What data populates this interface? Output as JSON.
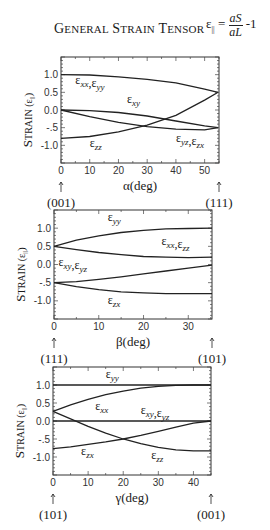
{
  "header": {
    "title": "General strain tensor",
    "formula_lhs": "ε",
    "formula_sub": "||",
    "formula_eq": "=",
    "formula_num": "aS",
    "formula_den": "aL",
    "formula_tail": "-1"
  },
  "chart_data": [
    {
      "type": "line",
      "title": "",
      "xlabel": "α(deg)",
      "ylabel": "Strain (ε||)",
      "xlim": [
        0,
        55
      ],
      "ylim": [
        -1.5,
        1.5
      ],
      "xticks": [
        0,
        10,
        20,
        30,
        40,
        50
      ],
      "yticks": [
        1.0,
        0.5,
        0.0,
        -0.5,
        -1.0
      ],
      "ytick_labels": [
        "1.0",
        "0.5",
        "0.0",
        "-.5",
        "-1.0"
      ],
      "grid": false,
      "direction_left": "(001)",
      "direction_right": "(111)",
      "x": [
        0,
        10,
        20,
        30,
        40,
        50,
        54.7
      ],
      "series": [
        {
          "name": "εxx,εyy",
          "values": [
            1.0,
            0.99,
            0.94,
            0.87,
            0.77,
            0.59,
            0.5
          ]
        },
        {
          "name": "εxy",
          "values": [
            0.0,
            -0.02,
            -0.07,
            -0.17,
            -0.31,
            -0.45,
            -0.5
          ]
        },
        {
          "name": "εzz",
          "values": [
            -0.8,
            -0.75,
            -0.62,
            -0.43,
            -0.15,
            0.28,
            0.5
          ]
        },
        {
          "name": "εyz,εzx",
          "values": [
            0.0,
            -0.19,
            -0.35,
            -0.47,
            -0.54,
            -0.56,
            -0.5
          ]
        }
      ],
      "annotations": [
        {
          "text": "εxx,εyy",
          "x": 5,
          "y": 0.75
        },
        {
          "text": "εxy",
          "x": 23,
          "y": 0.2
        },
        {
          "text": "εzz",
          "x": 10,
          "y": -1.05
        },
        {
          "text": "εyz,εzx",
          "x": 40,
          "y": -0.9
        }
      ]
    },
    {
      "type": "line",
      "title": "",
      "xlabel": "β(deg)",
      "ylabel": "Strain (ε||)",
      "xlim": [
        0,
        35.3
      ],
      "ylim": [
        -1.5,
        1.5
      ],
      "xticks": [
        0,
        10,
        20,
        30
      ],
      "yticks": [
        1.0,
        0.5,
        0.0,
        -0.5,
        -1.0
      ],
      "ytick_labels": [
        "1.0",
        "0.5",
        "0.0",
        "-.5",
        "-1.0"
      ],
      "grid": false,
      "direction_left": "(111)",
      "direction_right": "(101)",
      "x": [
        0,
        5,
        10,
        15,
        20,
        25,
        30,
        35.3
      ],
      "series": [
        {
          "name": "εyy",
          "values": [
            0.5,
            0.67,
            0.79,
            0.88,
            0.94,
            0.98,
            0.99,
            1.0
          ]
        },
        {
          "name": "εxx,εzz",
          "values": [
            0.5,
            0.41,
            0.33,
            0.27,
            0.22,
            0.2,
            0.19,
            0.2
          ]
        },
        {
          "name": "εxy,εyz",
          "values": [
            -0.5,
            -0.47,
            -0.41,
            -0.34,
            -0.26,
            -0.18,
            -0.1,
            -0.02
          ]
        },
        {
          "name": "εzx",
          "values": [
            -0.5,
            -0.61,
            -0.69,
            -0.75,
            -0.78,
            -0.8,
            -0.8,
            -0.8
          ]
        }
      ],
      "annotations": [
        {
          "text": "εyy",
          "x": 12,
          "y": 1.2
        },
        {
          "text": "εxx,εzz",
          "x": 24,
          "y": 0.55
        },
        {
          "text": "εxy,εyz",
          "x": 1,
          "y": -0.05
        },
        {
          "text": "εzx",
          "x": 12,
          "y": -1.1
        }
      ]
    },
    {
      "type": "line",
      "title": "",
      "xlabel": "γ(deg)",
      "ylabel": "Strain (ε||)",
      "xlim": [
        0,
        45
      ],
      "ylim": [
        -1.5,
        1.5
      ],
      "xticks": [
        0,
        10,
        20,
        30,
        40
      ],
      "yticks": [
        1.0,
        0.5,
        0.0,
        -0.5,
        -1.0
      ],
      "ytick_labels": [
        "1.0",
        "0.5",
        "0.0",
        "-.5",
        "-1.0"
      ],
      "grid": false,
      "direction_left": "(101)",
      "direction_right": "(001)",
      "x": [
        0,
        5,
        10,
        15,
        20,
        25,
        30,
        35,
        40,
        45
      ],
      "series": [
        {
          "name": "εyy",
          "values": [
            1.0,
            1.0,
            1.0,
            1.0,
            1.0,
            1.0,
            1.0,
            1.0,
            1.0,
            1.0
          ]
        },
        {
          "name": "εxx",
          "values": [
            0.27,
            0.45,
            0.6,
            0.73,
            0.83,
            0.91,
            0.96,
            0.99,
            1.0,
            1.0
          ]
        },
        {
          "name": "εxy,εyz",
          "values": [
            0.0,
            0.0,
            0.0,
            0.0,
            0.0,
            0.0,
            0.0,
            0.0,
            0.0,
            0.0
          ]
        },
        {
          "name": "εzz",
          "values": [
            0.27,
            0.06,
            -0.15,
            -0.34,
            -0.5,
            -0.63,
            -0.73,
            -0.8,
            -0.83,
            -0.83
          ]
        },
        {
          "name": "εzx",
          "values": [
            -0.77,
            -0.72,
            -0.65,
            -0.58,
            -0.5,
            -0.4,
            -0.29,
            -0.17,
            -0.06,
            0.0
          ]
        }
      ],
      "annotations": [
        {
          "text": "εyy",
          "x": 15,
          "y": 1.2
        },
        {
          "text": "εxx",
          "x": 12,
          "y": 0.3
        },
        {
          "text": "εxy,εyz",
          "x": 25,
          "y": 0.2
        },
        {
          "text": "εzx",
          "x": 8,
          "y": -0.95
        },
        {
          "text": "εzz",
          "x": 28,
          "y": -1.05
        }
      ]
    }
  ]
}
